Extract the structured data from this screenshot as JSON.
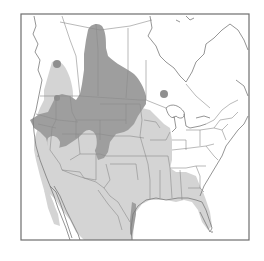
{
  "map": {
    "type": "species-range-map",
    "region": "North America",
    "frame": {
      "x": 21,
      "y": 14,
      "width": 228,
      "height": 226,
      "stroke": "#6e6e6e"
    },
    "colors": {
      "background": "#ffffff",
      "land": "#ffffff",
      "border_lines": "#8c8c8c",
      "coast_lines": "#7a7a7a",
      "range_dark": "#9e9e9e",
      "range_light": "#d4d4d4",
      "range_dot": "#8f8f8f"
    },
    "legend": [
      {
        "key": "range_dark",
        "label": ""
      },
      {
        "key": "range_light",
        "label": ""
      }
    ],
    "range_layers": [
      {
        "name": "dark-range",
        "color_key": "range_dark"
      },
      {
        "name": "light-range",
        "color_key": "range_light"
      },
      {
        "name": "isolated-dots",
        "color_key": "range_dot"
      }
    ]
  }
}
